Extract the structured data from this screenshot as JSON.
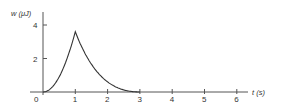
{
  "chart_data": {
    "type": "line",
    "title": "",
    "xlabel": "t (s)",
    "ylabel": "w (μJ)",
    "xlim": [
      0,
      6
    ],
    "ylim": [
      0,
      4
    ],
    "x_ticks": [
      "0",
      "1",
      "2",
      "3",
      "4",
      "5",
      "6"
    ],
    "y_ticks": [
      "2",
      "4"
    ],
    "grid": false,
    "legend": null,
    "series": [
      {
        "name": "w(t)",
        "x": [
          0,
          0.25,
          0.5,
          0.75,
          1.0,
          1.25,
          1.5,
          1.75,
          2.0,
          2.25,
          2.5,
          2.75,
          3.0,
          6.0
        ],
        "y": [
          0,
          0.23,
          0.9,
          2.03,
          3.6,
          2.03,
          1.1,
          0.55,
          0.22,
          0.08,
          0.02,
          0.005,
          0,
          0
        ]
      }
    ],
    "annotations": [
      {
        "text": "peak ≈ 3.6 μJ at t = 1 s"
      }
    ]
  }
}
